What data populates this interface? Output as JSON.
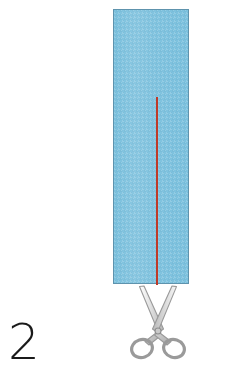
{
  "illustration": {
    "title": "Fabric strip cutting step",
    "step_label": "2",
    "background_color": "#ffffff"
  },
  "fabric_strip": {
    "name": "blue fabric strip",
    "fill_color": "#7cc1de",
    "border_color": "#5e93ad",
    "x": 113,
    "y": 9,
    "width": 76,
    "height": 275
  },
  "cut_line": {
    "name": "red cutting guide line",
    "color": "#bf3a28",
    "x": 156,
    "y": 97,
    "width": 2,
    "height": 188,
    "orientation": "vertical"
  },
  "scissors": {
    "name": "scissors-icon",
    "outline_color": "#9a9a9a",
    "fill_color": "#cfcfcf",
    "x": 128,
    "y": 284,
    "width": 60,
    "height": 76
  },
  "step_number": {
    "value": "2",
    "color": "#1a1a1a",
    "x": 8,
    "y": 316
  }
}
